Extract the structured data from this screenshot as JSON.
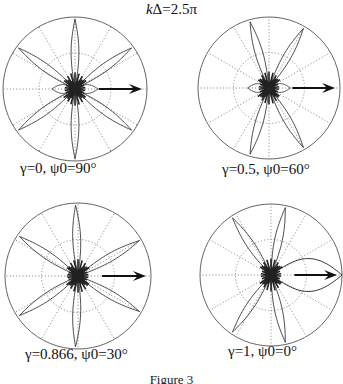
{
  "figure": {
    "title_k": "k",
    "title_rest": "Δ=2.5π",
    "figure_caption": "Figure 3"
  },
  "chart_data": [
    {
      "type": "polar",
      "title": "kΔ=2.5π",
      "label": "γ=0, ψ0=90°",
      "gamma": 0,
      "psi0_deg": 90,
      "center": [
        75,
        89
      ],
      "radius": 72,
      "caption_pos": [
        20,
        160
      ],
      "main_lobes_deg": [
        90,
        270,
        36,
        144,
        216,
        324
      ],
      "lobe_length": 0.97,
      "lobe_width": 0.07,
      "small_lobes_deg": [
        0,
        180
      ],
      "small_lobe_length": 0.32,
      "arrow_deg": 0,
      "grid": {
        "rings": [
          0.5,
          1.0
        ],
        "spokes_deg": [
          0,
          30,
          60,
          90,
          120,
          150,
          180,
          210,
          240,
          270,
          300,
          330
        ]
      }
    },
    {
      "type": "polar",
      "title": "kΔ=2.5π",
      "label": "γ=0.5, ψ0=60°",
      "gamma": 0.5,
      "psi0_deg": 60,
      "center": [
        269,
        88
      ],
      "radius": 71,
      "caption_pos": [
        222,
        161
      ],
      "main_lobes_deg": [
        60,
        106,
        254,
        300
      ],
      "lobe_length": 0.97,
      "lobe_width": 0.07,
      "small_lobes_deg": [
        180,
        0
      ],
      "small_lobe_length": 0.3,
      "arrow_deg": 0,
      "grid": {
        "rings": [
          0.5,
          1.0
        ],
        "spokes_deg": [
          0,
          30,
          60,
          90,
          120,
          150,
          180,
          210,
          240,
          270,
          300,
          330
        ]
      }
    },
    {
      "type": "polar",
      "title": "kΔ=2.5π",
      "label": "γ=0.866, ψ0=30°",
      "gamma": 0.866,
      "psi0_deg": 30,
      "center": [
        78,
        276
      ],
      "radius": 73,
      "caption_pos": [
        25,
        346
      ],
      "main_lobes_deg": [
        30,
        92,
        146,
        214,
        268,
        330
      ],
      "lobe_length": 0.97,
      "lobe_width": 0.07,
      "small_lobes_deg": [
        180
      ],
      "small_lobe_length": 0.15,
      "arrow_deg": 0,
      "grid": {
        "rings": [
          0.5,
          1.0
        ],
        "spokes_deg": [
          0,
          30,
          60,
          90,
          120,
          150,
          180,
          210,
          240,
          270,
          300,
          330
        ]
      }
    },
    {
      "type": "polar",
      "title": "kΔ=2.5π",
      "label": "γ=1, ψ0=0°",
      "gamma": 1,
      "psi0_deg": 0,
      "center": [
        271,
        275
      ],
      "radius": 71,
      "caption_pos": [
        228,
        343
      ],
      "main_lobes_deg": [
        78,
        124,
        236,
        282
      ],
      "lobe_length": 0.97,
      "lobe_width": 0.07,
      "broad_lobe_deg": 0,
      "broad_lobe_length": 1.0,
      "broad_lobe_width": 0.3,
      "arrow_deg": 0,
      "grid": {
        "rings": [
          0.5,
          1.0
        ],
        "spokes_deg": [
          0,
          30,
          60,
          90,
          120,
          150,
          180,
          210,
          240,
          270,
          300,
          330
        ]
      }
    }
  ]
}
